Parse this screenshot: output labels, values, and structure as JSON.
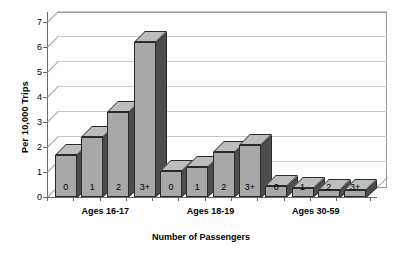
{
  "chart_data": {
    "type": "bar",
    "title": "",
    "xlabel": "Number of Passengers",
    "ylabel": "Per 10,000 Trips",
    "ylim": [
      0,
      7
    ],
    "yticks": [
      "0",
      "1",
      "2",
      "3",
      "4",
      "5",
      "6",
      "7"
    ],
    "grid": true,
    "legend": "none",
    "style": "3d-bar",
    "categories": [
      "0",
      "1",
      "2",
      "3+",
      "0",
      "1",
      "2",
      "3+",
      "0",
      "1",
      "2",
      "3+"
    ],
    "values": [
      1.7,
      2.4,
      3.4,
      6.2,
      1.05,
      1.2,
      1.8,
      2.1,
      0.45,
      0.35,
      0.3,
      0.3
    ],
    "groups": [
      {
        "label": "Ages 16-17",
        "categories": [
          "0",
          "1",
          "2",
          "3+"
        ],
        "values": [
          1.7,
          2.4,
          3.4,
          6.2
        ]
      },
      {
        "label": "Ages 18-19",
        "categories": [
          "0",
          "1",
          "2",
          "3+"
        ],
        "values": [
          1.05,
          1.2,
          1.8,
          2.1
        ]
      },
      {
        "label": "Ages 30-59",
        "categories": [
          "0",
          "1",
          "2",
          "3+"
        ],
        "values": [
          0.45,
          0.35,
          0.3,
          0.3
        ]
      }
    ],
    "colors": {
      "bar_face": "#a8a8a8",
      "bar_side": "#4d4d4d",
      "bar_top": "#bdbdbd",
      "bar_outline": "#2b2b2b",
      "gridline": "#c9c9c9",
      "axis": "#6b6b6b",
      "background": "#ffffff"
    }
  }
}
